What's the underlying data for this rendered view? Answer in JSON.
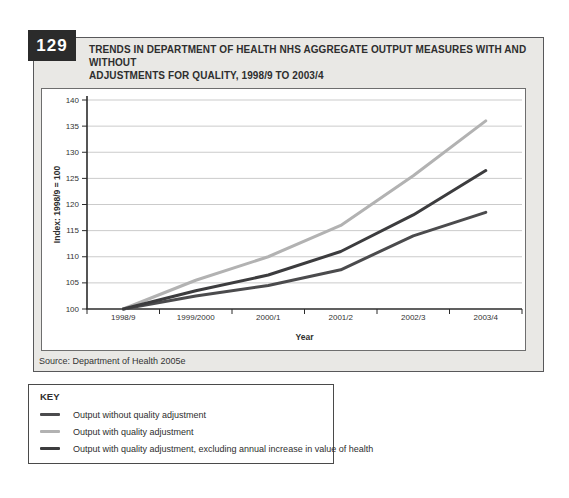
{
  "figure": {
    "number": "129",
    "title_line1": "TRENDS IN DEPARTMENT OF HEALTH NHS AGGREGATE OUTPUT MEASURES WITH AND WITHOUT",
    "title_line2": "ADJUSTMENTS FOR QUALITY, 1998/9 TO 2003/4",
    "source": "Source: Department of Health 2005e"
  },
  "key": {
    "title": "KEY",
    "entries": [
      {
        "label": "Output without quality adjustment",
        "color": "#4b4b4d"
      },
      {
        "label": "Output with quality adjustment",
        "color": "#b2b2b2"
      },
      {
        "label": "Output with quality adjustment, excluding annual increase in value of health",
        "color": "#3c3c3e"
      }
    ]
  },
  "chart_data": {
    "type": "line",
    "title": "Trends in Department of Health NHS aggregate output measures with and without adjustments for quality, 1998/9 to 2003/4",
    "xlabel": "Year",
    "ylabel": "Index: 1998/9 = 100",
    "categories": [
      "1998/9",
      "1999/2000",
      "2000/1",
      "2001/2",
      "2002/3",
      "2003/4"
    ],
    "y_ticks": [
      100,
      105,
      110,
      115,
      120,
      125,
      130,
      135,
      140
    ],
    "ylim": [
      100,
      140
    ],
    "grid": "horizontal",
    "legend_position": "separate-key-box-below",
    "series": [
      {
        "name": "Output without quality adjustment",
        "color": "#4b4b4d",
        "values": [
          100,
          102.5,
          104.5,
          107.5,
          114,
          118.5
        ]
      },
      {
        "name": "Output with quality adjustment",
        "color": "#b2b2b2",
        "values": [
          100,
          105.5,
          110,
          116,
          125.5,
          136
        ]
      },
      {
        "name": "Output with quality adjustment, excluding annual increase in value of health",
        "color": "#3c3c3e",
        "values": [
          100,
          103.5,
          106.5,
          111,
          118,
          126.5
        ]
      }
    ]
  }
}
